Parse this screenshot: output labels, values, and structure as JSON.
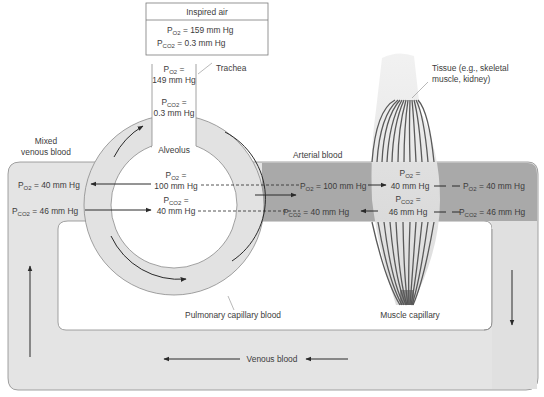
{
  "inspired_air": {
    "title": "Inspired air",
    "po2_label": "P",
    "po2_sub": "O2",
    "po2_value": "= 159 mm Hg",
    "pco2_label": "P",
    "pco2_sub": "CO2",
    "pco2_value": "= 0.3 mm Hg"
  },
  "trachea": {
    "label": "Trachea",
    "po2_sub": "O2",
    "po2_eq": "=",
    "po2_value": "149 mm Hg",
    "pco2_sub": "CO2",
    "pco2_eq": "=",
    "pco2_value": "0.3 mm Hg"
  },
  "alveolus": {
    "label": "Alveolus",
    "po2_sub": "O2",
    "po2_eq": "=",
    "po2_value": "100 mm Hg",
    "pco2_sub": "CO2",
    "pco2_eq": "=",
    "pco2_value": "40 mm Hg"
  },
  "mixed_venous": {
    "label_line1": "Mixed",
    "label_line2": "venous blood",
    "po2_sub": "O2",
    "po2_value": "= 40 mm Hg",
    "pco2_sub": "CO2",
    "pco2_value": "= 46 mm Hg"
  },
  "arterial": {
    "label": "Arterial blood",
    "po2_sub": "O2",
    "po2_value": "= 100 mm Hg",
    "pco2_sub": "CO2",
    "pco2_value": "= 40 mm Hg"
  },
  "tissue": {
    "label_line1": "Tissue (e.g., skeletal",
    "label_line2": "muscle, kidney)",
    "po2_sub": "O2",
    "po2_eq": "=",
    "po2_value": "40 mm Hg",
    "pco2_sub": "CO2",
    "pco2_eq": "=",
    "pco2_value": "46 mm Hg"
  },
  "venous_out": {
    "po2_sub": "O2",
    "po2_value": "= 40 mm Hg",
    "pco2_sub": "CO2",
    "pco2_value": "= 46 mm Hg"
  },
  "labels": {
    "pulmonary_capillary": "Pulmonary capillary blood",
    "muscle_capillary": "Muscle capillary",
    "venous_blood": "Venous blood",
    "p": "P"
  },
  "colors": {
    "vessel_light": "#e4e4e4",
    "vessel_dark": "#a9a9a9",
    "outline": "#8a8a8a",
    "arrow": "#2a2a2a",
    "capillary_line": "#555555"
  }
}
